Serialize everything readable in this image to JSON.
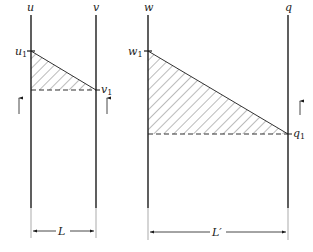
{
  "diagram": {
    "left_panel": {
      "line_a_label": "u",
      "line_b_label": "v",
      "point_a_label": "u",
      "point_a_sub": "1",
      "point_b_label": "v",
      "point_b_sub": "1",
      "width_label": "L"
    },
    "right_panel": {
      "line_a_label": "w",
      "line_b_label": "q",
      "point_a_label": "w",
      "point_a_sub": "1",
      "point_b_label": "q",
      "point_b_sub": "1",
      "width_label": "L′"
    },
    "colors": {
      "line": "#1a1a1a",
      "hatch": "#555555",
      "background": "#ffffff"
    }
  }
}
